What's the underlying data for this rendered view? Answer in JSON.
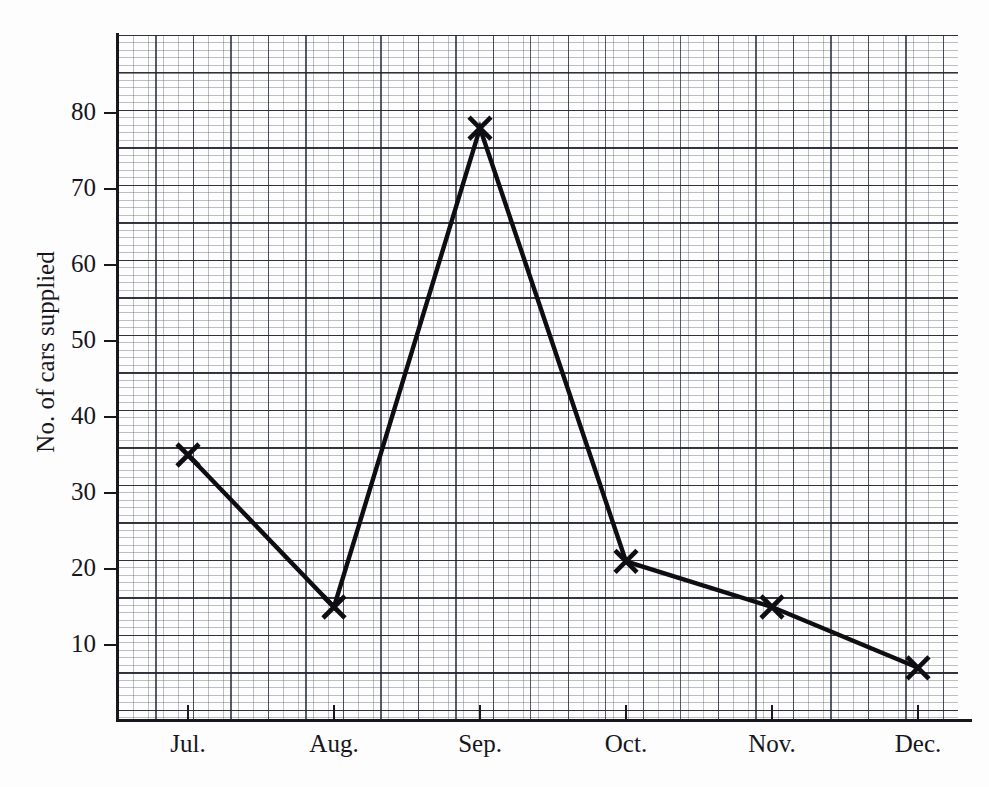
{
  "chart_data": {
    "type": "line",
    "title": "",
    "subtitle": "",
    "xlabel": "",
    "ylabel": "No. of cars supplied",
    "categories": [
      "Jul.",
      "Aug.",
      "Sep.",
      "Oct.",
      "Nov.",
      "Dec."
    ],
    "values": [
      35,
      15,
      78,
      21,
      15,
      7
    ],
    "series": [
      {
        "name": "No. of cars supplied",
        "values": [
          35,
          15,
          78,
          21,
          15,
          7
        ]
      }
    ],
    "y_ticks": [
      10,
      20,
      30,
      40,
      50,
      60,
      70,
      80
    ],
    "ylim": [
      0,
      88
    ],
    "xlim_labels": [
      "Jul.",
      "Dec."
    ],
    "grid": true,
    "grid_style": "graph-paper",
    "legend": "none",
    "marker": "x",
    "line_color": "#0d0d12",
    "grid_color": "#5a5f6e",
    "axis_color": "#17171d",
    "background_color": "#fdfdfd"
  },
  "axes": {
    "y_title": "No. of cars supplied",
    "y_tick_labels": [
      "80",
      "70",
      "60",
      "50",
      "40",
      "30",
      "20",
      "10"
    ],
    "x_tick_labels": [
      "Jul.",
      "Aug.",
      "Sep.",
      "Oct.",
      "Nov.",
      "Dec."
    ]
  }
}
